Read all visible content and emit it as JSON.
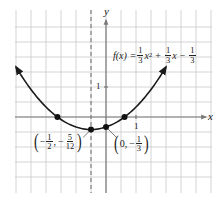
{
  "chart_data": {
    "type": "line",
    "title": "",
    "function": {
      "label": "f(x) = 1/3 x^2 + 1/3 x - 1/3",
      "coefficients": {
        "a": 0.3333,
        "b": 0.3333,
        "c": -0.3333
      }
    },
    "xlabel": "x",
    "ylabel": "y",
    "xlim": [
      -3,
      3.5
    ],
    "ylim": [
      -2.5,
      3.5
    ],
    "grid": true,
    "grid_step": 0.5,
    "tick_labels": {
      "x": [
        "1"
      ],
      "y": [
        "1"
      ]
    },
    "axis_of_symmetry": {
      "x": -0.5,
      "style": "dashed"
    },
    "points": [
      {
        "x": -1.618,
        "y": 0,
        "label": ""
      },
      {
        "x": -0.5,
        "y": -0.4167,
        "label": "(-1/2, -5/12)"
      },
      {
        "x": 0,
        "y": -0.3333,
        "label": "(0, -1/3)"
      },
      {
        "x": 0.618,
        "y": 0,
        "label": ""
      }
    ],
    "curve_domain": [
      -3,
      2
    ]
  },
  "labels": {
    "x_axis": "x",
    "y_axis": "y",
    "x_tick_one": "1",
    "y_tick_one": "1",
    "formula": {
      "lhs": "f(x) =",
      "t1_num": "1",
      "t1_den": "3",
      "t1_var": "x",
      "t1_exp": "2",
      "op1": "+",
      "t2_num": "1",
      "t2_den": "3",
      "t2_var": "x",
      "op2": "−",
      "t3_num": "1",
      "t3_den": "3"
    },
    "vertex": {
      "open": "(",
      "sign1": "−",
      "x_num": "1",
      "x_den": "2",
      "comma": ",",
      "sign2": "−",
      "y_num": "5",
      "y_den": "12",
      "close": ")"
    },
    "yint": {
      "open": "(",
      "x": "0",
      "comma": ",",
      "sign": "−",
      "y_num": "1",
      "y_den": "3",
      "close": ")"
    }
  },
  "layout": {
    "origin_px": [
      106,
      117
    ],
    "unit_px": 30,
    "grid_bounds_px": {
      "left": 15,
      "right": 212,
      "top": 10,
      "bottom": 193
    }
  },
  "colors": {
    "grid": "#c9c9c9",
    "axis": "#7a7a7a",
    "curve": "#1a1a1a",
    "background": "#ffffff"
  }
}
